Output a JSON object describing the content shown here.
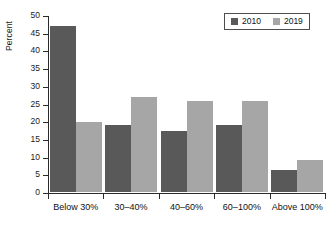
{
  "chart_data": {
    "type": "bar",
    "title": "",
    "subtitle": "",
    "xlabel": "",
    "ylabel": "Percent",
    "categories": [
      "Below 30%",
      "30–40%",
      "40–60%",
      "60–100%",
      "Above 100%"
    ],
    "series": [
      {
        "name": "2010",
        "color": "#595959",
        "values": [
          47.0,
          18.8,
          17.1,
          18.9,
          6.1
        ]
      },
      {
        "name": "2019",
        "color": "#a6a6a6",
        "values": [
          19.7,
          26.8,
          25.8,
          25.8,
          9.1
        ]
      }
    ],
    "ylim": [
      0,
      50
    ],
    "ytick_values": [
      0,
      5,
      10,
      15,
      20,
      25,
      30,
      35,
      40,
      45,
      50
    ],
    "ytick_labels": [
      "0",
      "5",
      "10",
      "15",
      "20",
      "25",
      "30",
      "35",
      "40",
      "45",
      "50"
    ],
    "grid": false,
    "legend_position": "top-right",
    "legend_entries": [
      "2010",
      "2019"
    ],
    "annotations": []
  }
}
